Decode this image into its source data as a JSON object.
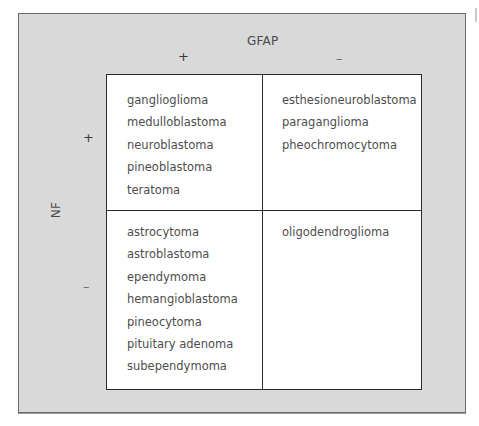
{
  "figure": {
    "column_marker": "GFAP",
    "row_marker": "NF",
    "column_signs": [
      "+",
      "–"
    ],
    "row_signs": [
      "+",
      "–"
    ],
    "cells": {
      "gfap_pos_nf_pos": [
        "ganglioglioma",
        "medulloblastoma",
        "neuroblastoma",
        "pineoblastoma",
        "teratoma"
      ],
      "gfap_neg_nf_pos": [
        "esthesioneuroblastoma",
        "paraganglioma",
        "pheochromocytoma"
      ],
      "gfap_pos_nf_neg": [
        "astrocytoma",
        "astroblastoma",
        "ependymoma",
        "hemangioblastoma",
        "pineocytoma",
        "pituitary adenoma",
        "subependymoma"
      ],
      "gfap_neg_nf_neg": [
        "oligodendroglioma"
      ]
    }
  },
  "colors": {
    "panel_background": "#d9d9d9",
    "grid_background": "#ffffff",
    "grid_lines": "#2a2a2a",
    "text": "#4d4d4d"
  }
}
